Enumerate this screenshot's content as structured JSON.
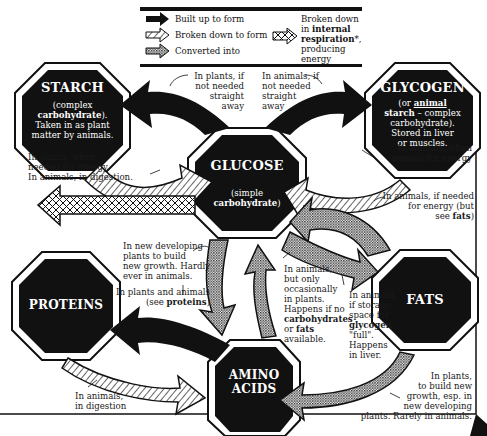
{
  "legend": {
    "built_up": "Built up to form",
    "broken_down": "Broken down to form",
    "converted": "Converted into",
    "respiration_pre": "Broken down",
    "respiration_in": "in ",
    "respiration_bold": "internal",
    "respiration_bold2": "respiration",
    "respiration_post": "*,",
    "respiration_end": "producing energy"
  },
  "nodes": {
    "starch": {
      "title": "STARCH",
      "sub1": "(complex",
      "sub2": "carbohydrate",
      "sub2b": ").",
      "sub3": "Taken in as plant",
      "sub4": "matter by animals."
    },
    "glycogen": {
      "title": "GLYCOGEN",
      "sub1a": "(or ",
      "sub1b": "animal",
      "sub2a": "starch",
      "sub2b": " – complex",
      "sub3": "carbohydrate).",
      "sub4": "Stored in liver",
      "sub5": "or muscles."
    },
    "glucose": {
      "title": "GLUCOSE",
      "sub1": "(simple",
      "sub2": "carbohydrate",
      "sub2b": ")"
    },
    "proteins": {
      "title": "PROTEINS"
    },
    "fats": {
      "title": "FATS"
    },
    "amino": {
      "title1": "AMINO",
      "title2": "ACIDS"
    }
  },
  "labels": {
    "plants_not_needed": [
      "In plants, if",
      "not needed",
      "straight",
      "away"
    ],
    "animals_not_needed": [
      "In animals, if",
      "not needed",
      "straight",
      "away"
    ],
    "plants_energy": [
      "In plants, when",
      "needed for energy.",
      "In animals, in digestion."
    ],
    "animals_energy": [
      "In animals, when",
      "needed for energy"
    ],
    "animals_fats": [
      "In animals, if needed",
      "for energy (but",
      "see ",
      "fats",
      ")"
    ],
    "new_developing": [
      "In new developing",
      "plants to build",
      "new growth. Hardly",
      "ever in animals."
    ],
    "plants_and_animals": [
      "In plants and animals",
      "(see ",
      "proteins",
      ")"
    ],
    "animals_occasionally": [
      "In animals,",
      "but only",
      "occasionally",
      "in plants.",
      "Happens if no",
      "carbohydrates",
      "or ",
      "fats",
      "available."
    ],
    "animals_storage": [
      "In animals,",
      "if storage",
      "space for",
      "glycogen",
      "\"full\".",
      "Happens",
      "in liver."
    ],
    "animals_digestion": [
      "In animals,",
      "in digestion"
    ],
    "plants_new_growth": [
      "In plants,",
      "to build new",
      "growth, esp. in",
      "new developing",
      "plants. Rarely in animals."
    ]
  },
  "colors": {
    "ink": "#111111",
    "paper": "#ffffff"
  }
}
